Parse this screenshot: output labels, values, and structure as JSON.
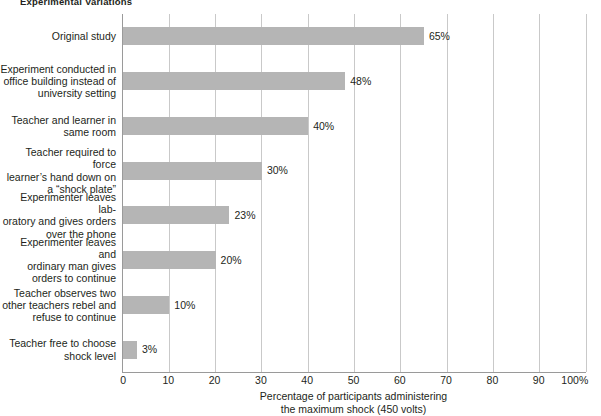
{
  "chart_data": {
    "type": "bar",
    "orientation": "horizontal",
    "title": "Experimental Variations",
    "xlabel_line1": "Percentage of participants administering",
    "xlabel_line2": "the maximum shock (450 volts)",
    "ylabel": "",
    "xlim": [
      0,
      100
    ],
    "xticks": [
      "0",
      "10",
      "20",
      "30",
      "40",
      "50",
      "60",
      "70",
      "80",
      "90",
      "100%"
    ],
    "xtick_values": [
      0,
      10,
      20,
      30,
      40,
      50,
      60,
      70,
      80,
      90,
      100
    ],
    "grid": true,
    "grid_axis": "x",
    "legend": null,
    "bar_color": "#b5b5b5",
    "axis_color": "#9a9a9a",
    "grid_color": "#c9c9c9",
    "text_color": "#231f20",
    "categories": [
      "Original study",
      "Experiment conducted in office building instead of university setting",
      "Teacher and learner in same room",
      "Teacher required to force learner’s hand down on a “shock plate”",
      "Experimenter leaves laboratory and gives orders over the phone",
      "Experimenter leaves and ordinary man gives orders to continue",
      "Teacher observes two other teachers rebel and refuse to continue",
      "Teacher free to choose shock level"
    ],
    "category_lines": [
      [
        "Original study"
      ],
      [
        "Experiment conducted in",
        "office building instead of",
        "university setting"
      ],
      [
        "Teacher and learner in",
        "same room"
      ],
      [
        "Teacher required to force",
        "learner’s hand down on",
        "a “shock plate”"
      ],
      [
        "Experimenter leaves lab-",
        "oratory and gives orders",
        "over the phone"
      ],
      [
        "Experimenter leaves and",
        "ordinary man gives",
        "orders to continue"
      ],
      [
        "Teacher observes two",
        "other teachers rebel and",
        "refuse to continue"
      ],
      [
        "Teacher free to choose",
        "shock level"
      ]
    ],
    "values": [
      65,
      48,
      40,
      30,
      23,
      20,
      10,
      3
    ],
    "value_labels": [
      "65%",
      "48%",
      "40%",
      "30%",
      "23%",
      "20%",
      "10%",
      "3%"
    ]
  }
}
